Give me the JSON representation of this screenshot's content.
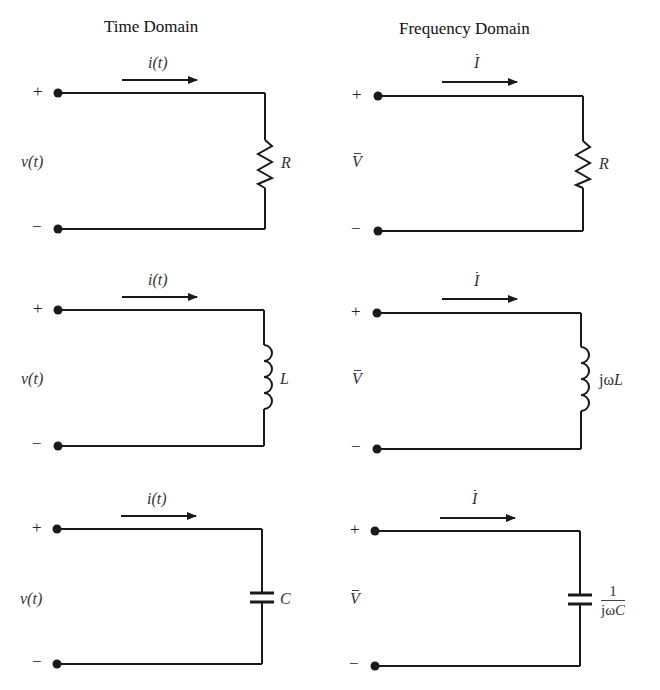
{
  "headings": {
    "time_domain": "Time Domain",
    "frequency_domain": "Frequency Domain"
  },
  "signs": {
    "plus": "+",
    "minus": "−"
  },
  "time_domain": {
    "current_label": "i(t)",
    "voltage_label": "v(t)",
    "rows": [
      {
        "element": "resistor",
        "label": "R"
      },
      {
        "element": "inductor",
        "label": "L"
      },
      {
        "element": "capacitor",
        "label": "C"
      }
    ]
  },
  "frequency_domain": {
    "current_label": "I",
    "voltage_label": "V",
    "rows": [
      {
        "element": "resistor",
        "label": "R"
      },
      {
        "element": "inductor",
        "label_prefix": "jω",
        "label_var": "L"
      },
      {
        "element": "capacitor",
        "numerator": "1",
        "denominator_prefix": "jω",
        "denominator_var": "C"
      }
    ]
  },
  "colors": {
    "line": "#1a1a1a",
    "text": "#333333",
    "background": "#ffffff"
  }
}
